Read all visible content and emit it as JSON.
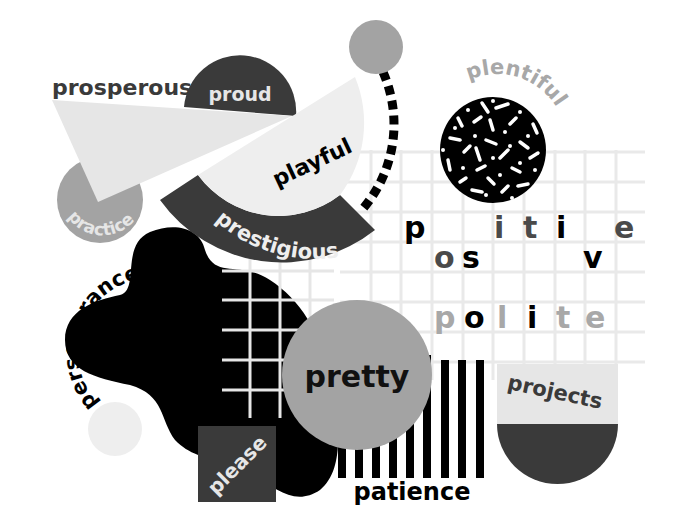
{
  "colors": {
    "background": "#ffffff",
    "black": "#000000",
    "dark_gray": "#3a3a3a",
    "mid_gray": "#a3a3a3",
    "light_gray": "#e6e6e6",
    "very_light_gray": "#eeeeee",
    "grid_line": "#e9e9e9"
  },
  "words": {
    "prosperous": "prosperous",
    "proud": "proud",
    "playful": "playful",
    "plentiful": "plentiful",
    "practice": "practice",
    "prestigious": "prestigious",
    "perseverance": "perseverance",
    "pretty": "pretty",
    "please": "please",
    "patience": "patience",
    "projects": "projects"
  },
  "grid_words": {
    "positive": {
      "row1": [
        {
          "char": "p",
          "color": "#000000"
        },
        {
          "char": "i",
          "color": "#4a4a4a"
        },
        {
          "char": "t",
          "color": "#4a4a4a"
        },
        {
          "char": "i",
          "color": "#000000"
        },
        {
          "char": "e",
          "color": "#4a4a4a"
        }
      ],
      "row2": [
        {
          "char": "o",
          "color": "#4a4a4a"
        },
        {
          "char": "s",
          "color": "#000000"
        },
        {
          "char": "v",
          "color": "#000000"
        }
      ]
    },
    "polite": [
      {
        "char": "p",
        "color": "#a8a8a8"
      },
      {
        "char": "o",
        "color": "#000000"
      },
      {
        "char": "l",
        "color": "#a8a8a8"
      },
      {
        "char": "i",
        "color": "#000000"
      },
      {
        "char": "t",
        "color": "#a8a8a8"
      },
      {
        "char": "e",
        "color": "#a8a8a8"
      }
    ]
  }
}
